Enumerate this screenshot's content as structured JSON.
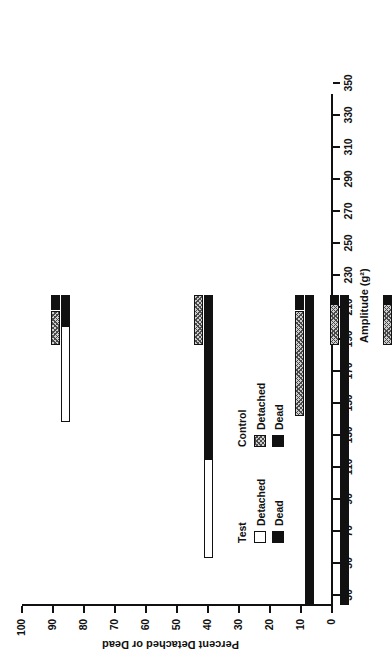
{
  "chart_data": {
    "type": "bar",
    "orientation": "horizontal-stacked",
    "title": "",
    "xlabel": "Amplitude (g²)",
    "ylabel": "Percent Detached or Dead",
    "xlim": [
      30,
      350
    ],
    "ylim": [
      0,
      100
    ],
    "grid": false,
    "legend_position": "bottom-left",
    "x_ticks": [
      30,
      50,
      70,
      90,
      110,
      130,
      150,
      170,
      190,
      210,
      230,
      250,
      270,
      290,
      310,
      330,
      350
    ],
    "y_ticks": [
      0,
      10,
      20,
      30,
      40,
      50,
      60,
      70,
      80,
      90,
      100
    ],
    "legend": [
      {
        "group": "Test",
        "entries": [
          {
            "label": "Detached",
            "swatch": "white"
          },
          {
            "label": "Dead",
            "swatch": "black"
          }
        ]
      },
      {
        "group": "Control",
        "entries": [
          {
            "label": "Detached",
            "swatch": "hatched"
          },
          {
            "label": "Dead",
            "swatch": "black"
          }
        ]
      }
    ],
    "series": [
      {
        "name": "Test Dead",
        "key": "test_dead",
        "swatch": "black"
      },
      {
        "name": "Test Detached",
        "key": "test_detached",
        "swatch": "white"
      },
      {
        "name": "Control Dead",
        "key": "ctl_dead",
        "swatch": "black"
      },
      {
        "name": "Control Detached",
        "key": "ctl_detached",
        "swatch": "hatched"
      }
    ],
    "bars": [
      {
        "amplitude": 48,
        "test_dead": 10,
        "test_detached": 31,
        "ctl_dead": 5,
        "ctl_detached": 11
      },
      {
        "amplitude": 137,
        "test_dead": 53,
        "test_detached": 32,
        "ctl_dead": 0,
        "ctl_detached": 16
      },
      {
        "amplitude": 200,
        "test_dead": 100,
        "test_detached": 0,
        "ctl_dead": 5,
        "ctl_detached": 34
      },
      {
        "amplitude": 222,
        "test_dead": 100,
        "test_detached": 0,
        "ctl_dead": 3,
        "ctl_detached": 13
      },
      {
        "amplitude": 255,
        "test_dead": 70,
        "test_detached": 26,
        "ctl_dead": 3,
        "ctl_detached": 13
      },
      {
        "amplitude": 290,
        "test_dead": 100,
        "test_detached": 0,
        "ctl_dead": 4,
        "ctl_detached": 29
      },
      {
        "amplitude": 348,
        "test_dead": 100,
        "test_detached": 0,
        "ctl_dead": 1,
        "ctl_detached": 16
      }
    ]
  }
}
